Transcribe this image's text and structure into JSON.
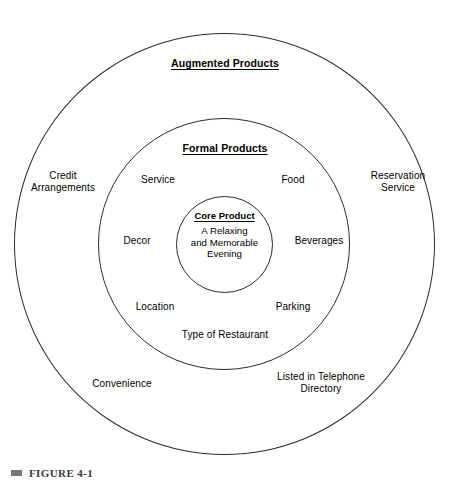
{
  "figure": {
    "caption_bullet": "square-bullet",
    "caption": "FIGURE 4-1"
  },
  "chart_data": {
    "type": "diagram",
    "diagram_kind": "concentric-circles",
    "rings": [
      {
        "id": "augmented",
        "level": 3,
        "title": "Augmented Products",
        "title_underlined": true,
        "items": [
          "Credit Arrangements",
          "Reservation Service",
          "Convenience",
          "Listed in Telephone Directory"
        ]
      },
      {
        "id": "formal",
        "level": 2,
        "title": "Formal Products",
        "title_underlined": true,
        "items": [
          "Service",
          "Food",
          "Decor",
          "Beverages",
          "Location",
          "Parking",
          "Type of Restaurant"
        ]
      },
      {
        "id": "core",
        "level": 1,
        "title": "Core Product",
        "title_underlined": true,
        "items": [
          "A Relaxing and Memorable Evening"
        ]
      }
    ],
    "labels": {
      "augmented_products": "Augmented Products",
      "formal_products": "Formal Products",
      "core_product": "Core Product",
      "core_body": "A Relaxing\nand Memorable\nEvening",
      "credit_arrangements": "Credit\nArrangements",
      "reservation_service": "Reservation\nService",
      "convenience": "Convenience",
      "listed_in_telephone_directory": "Listed in Telephone\nDirectory",
      "service": "Service",
      "food": "Food",
      "decor": "Decor",
      "beverages": "Beverages",
      "location": "Location",
      "parking": "Parking",
      "type_of_restaurant": "Type of Restaurant"
    },
    "colors": {
      "background": "#ffffff",
      "stroke": "#2b2b2b",
      "text": "#000000",
      "caption_text": "#3a3a3a",
      "caption_bullet": "#777777"
    }
  }
}
